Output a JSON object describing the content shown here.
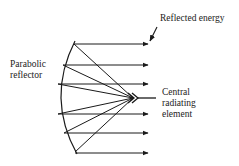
{
  "diagram": {
    "labels": {
      "reflected_energy": "Reflected energy",
      "parabolic_reflector_line1": "Parabolic",
      "parabolic_reflector_line2": "reflector",
      "central_element_line1": "Central",
      "central_element_line2": "radiating",
      "central_element_line3": "element"
    },
    "colors": {
      "stroke": "#1a1a1a",
      "text": "#222222",
      "background": "#ffffff"
    },
    "geometry": {
      "focal_point": [
        133,
        98
      ],
      "reflector_top": [
        75,
        41
      ],
      "reflector_bottom": [
        77,
        154
      ],
      "reflection_points": [
        [
          75,
          44
        ],
        [
          62,
          65
        ],
        [
          57,
          84
        ],
        [
          57,
          114
        ],
        [
          63,
          133
        ],
        [
          75,
          153
        ]
      ],
      "arrow_end_x": 148
    },
    "elements": [
      "parabolic-reflector",
      "central-radiating-element",
      "reflected-energy-rays",
      "reflected-energy-pointer"
    ]
  }
}
